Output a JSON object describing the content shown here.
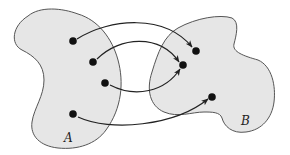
{
  "diagram": {
    "type": "set-mapping",
    "sets": [
      {
        "id": "A",
        "label": "A",
        "fill": "#e6e6e6",
        "stroke": "#555555"
      },
      {
        "id": "B",
        "label": "B",
        "fill": "#e6e6e6",
        "stroke": "#555555"
      }
    ],
    "points": {
      "A": [
        {
          "id": "a1",
          "x": 73,
          "y": 41
        },
        {
          "id": "a2",
          "x": 93,
          "y": 62
        },
        {
          "id": "a3",
          "x": 105,
          "y": 83
        },
        {
          "id": "a4",
          "x": 73,
          "y": 114
        }
      ],
      "B": [
        {
          "id": "b1",
          "x": 196,
          "y": 51
        },
        {
          "id": "b2",
          "x": 183,
          "y": 65
        },
        {
          "id": "b3",
          "x": 212,
          "y": 97
        }
      ]
    },
    "arrows": [
      {
        "from": "a1",
        "to": "b1"
      },
      {
        "from": "a2",
        "to": "b2"
      },
      {
        "from": "a3",
        "to": "b2"
      },
      {
        "from": "a4",
        "to": "b3"
      }
    ],
    "colors": {
      "background": "#ffffff",
      "region_fill": "#e6e6e6",
      "outline": "#555555",
      "point": "#111111",
      "arrow": "#222222"
    }
  }
}
